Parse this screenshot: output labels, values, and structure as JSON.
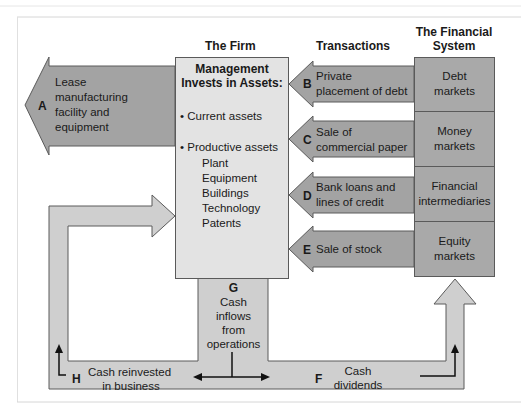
{
  "headers": {
    "firm": "The Firm",
    "transactions": "Transactions",
    "financial_system_line1": "The Financial",
    "financial_system_line2": "System"
  },
  "firm_box": {
    "title_line1": "Management",
    "title_line2": "Invests in Assets:",
    "bullet1": "• Current assets",
    "bullet2": "• Productive assets",
    "sub_items": [
      "Plant",
      "Equipment",
      "Buildings",
      "Technology",
      "Patents"
    ]
  },
  "flows": {
    "A": {
      "letter": "A",
      "lines": [
        "Lease",
        "manufacturing",
        "facility and",
        "equipment"
      ]
    },
    "B": {
      "letter": "B",
      "lines": [
        "Private",
        "placement of debt"
      ]
    },
    "C": {
      "letter": "C",
      "lines": [
        "Sale of",
        "commercial paper"
      ]
    },
    "D": {
      "letter": "D",
      "lines": [
        "Bank loans and",
        "lines of credit"
      ]
    },
    "E": {
      "letter": "E",
      "lines": [
        "Sale of stock"
      ]
    },
    "F": {
      "letter": "F",
      "lines": [
        "Cash",
        "dividends"
      ]
    },
    "G": {
      "letter": "G",
      "lines": [
        "Cash",
        "inflows",
        "from",
        "operations"
      ]
    },
    "H": {
      "letter": "H",
      "lines": [
        "Cash reinvested",
        "in business"
      ]
    }
  },
  "markets": [
    {
      "lines": [
        "Debt",
        "markets"
      ]
    },
    {
      "lines": [
        "Money",
        "markets"
      ]
    },
    {
      "lines": [
        "Financial",
        "intermediaries"
      ]
    },
    {
      "lines": [
        "Equity",
        "markets"
      ]
    }
  ],
  "colors": {
    "dark_arrow": "#a3a3a3",
    "light_arrow": "#cfcfcf",
    "firm_box": "#e3e3e3",
    "market_box": "#a9a9a9",
    "outline": "#5a5a5a"
  }
}
